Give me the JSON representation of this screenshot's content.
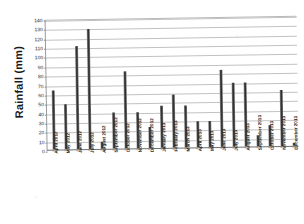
{
  "chart_data": {
    "type": "bar",
    "title": "",
    "xlabel": "",
    "ylabel": "Rainfall (mm)",
    "ylim": [
      0,
      140
    ],
    "ytick_step": 10,
    "yticks": [
      "140",
      "130",
      "120",
      "110",
      "100",
      "90",
      "80",
      "70",
      "60",
      "50",
      "40",
      "30",
      "20",
      "10",
      "0"
    ],
    "grid": true,
    "legend": "none",
    "bar_color": "#333333",
    "categories": [
      "April 2012",
      "May 2012",
      "June 2012",
      "July 2012",
      "August 2012",
      "September 2012",
      "October 2012",
      "November 2012",
      "December 2012",
      "January 2013",
      "February 2013",
      "March 2013",
      "April 2013",
      "May 2013",
      "June 2013",
      "July 2013",
      "August 2013",
      "September 2013",
      "October 2013",
      "November 2013",
      "December 2013"
    ],
    "values": [
      63,
      48,
      110,
      128,
      8,
      38,
      82,
      38,
      22,
      45,
      57,
      45,
      28,
      28,
      82,
      68,
      68,
      12,
      22,
      60,
      3
    ]
  }
}
